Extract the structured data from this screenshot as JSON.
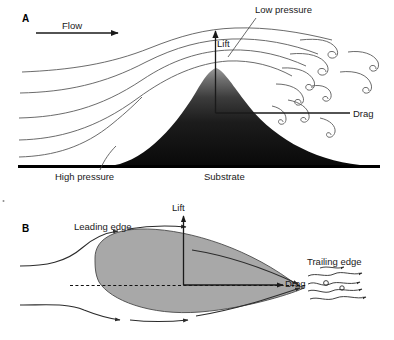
{
  "figure": {
    "background_color": "#ffffff",
    "width": 394,
    "height": 340
  },
  "panel_a": {
    "letter": "A",
    "labels": {
      "flow": "Flow",
      "low_pressure": "Low pressure",
      "lift": "Lift",
      "drag": "Drag",
      "high_pressure": "High pressure",
      "substrate": "Substrate"
    },
    "colors": {
      "mound_top": "#8c8c8c",
      "mound_bottom": "#0d0d0d",
      "streamline": "#5a5a5a",
      "ground": "#000000",
      "vector": "#1a1a1a"
    },
    "streamline_count": 5,
    "eddy_count": 9
  },
  "panel_b": {
    "letter": "B",
    "labels": {
      "lift": "Lift",
      "drag": "Drag",
      "leading_edge": "Leading edge",
      "trailing_edge": "Trailing edge"
    },
    "colors": {
      "airfoil_fill": "#a8a8a8",
      "airfoil_stroke": "#4a4a4a",
      "streamline": "#2b2b2b",
      "chord_line": "#111111"
    },
    "streamline_count": 4,
    "wake_squiggle_count": 5
  }
}
